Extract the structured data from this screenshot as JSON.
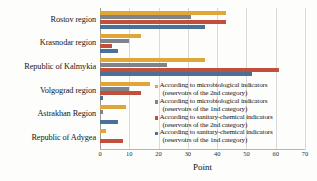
{
  "chart_data": {
    "type": "bar",
    "orientation": "horizontal",
    "title": "",
    "xlabel": "Point",
    "ylabel": "",
    "xlim": [
      0,
      70
    ],
    "xticks": [
      0,
      10,
      20,
      30,
      40,
      50,
      60,
      70
    ],
    "grid": true,
    "legend_position": "inside-right",
    "categories": [
      "Rostov region",
      "Krasnodar region",
      "Republic of Kalmykia",
      "Volgograd region",
      "Astrakhan Region",
      "Republic of Adygea"
    ],
    "series": [
      {
        "name": "According to microbiological indicators (reservoirs of the 2nd category)",
        "name_line1": "According to microbiological indicators",
        "name_line2": "(reservoirs of the 2nd category)",
        "color": "#E0A637",
        "values": [
          43,
          14,
          36,
          17,
          9,
          2
        ]
      },
      {
        "name": "According to microbiological indicators (reservoirs of the 1nd category)",
        "name_line1": "According to microbiological indicators",
        "name_line2": "(reservoirs of the 1nd category)",
        "color": "#7E8488",
        "values": [
          31,
          10,
          23,
          10,
          1,
          0
        ]
      },
      {
        "name": "According to sanitary-chemical indicators (reservoirs of the 2nd category)",
        "name_line1": "According to sanitary-chemical indicators",
        "name_line2": "(reservoirs of the 2nd category)",
        "color": "#C0503C",
        "values": [
          43,
          4,
          61,
          14,
          0,
          8
        ]
      },
      {
        "name": "According to sanitary-chemical indicators (reservoirs of the 1nd category)",
        "name_line1": "According to sanitary-chemical indicators",
        "name_line2": "(reservoirs of the 1nd category)",
        "color": "#4A7098",
        "values": [
          36,
          6,
          52,
          1,
          6,
          0
        ]
      }
    ]
  }
}
